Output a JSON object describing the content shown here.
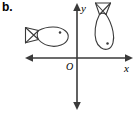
{
  "figure": {
    "part_label": "b.",
    "axes": {
      "x_label": "x",
      "y_label": "y",
      "origin_label": "O",
      "stroke_color": "#3a3a3a",
      "x_axis_y": 58,
      "y_axis_x": 77,
      "x_min": 25,
      "x_max": 133,
      "y_top": 3,
      "y_bottom": 110
    },
    "shapes": [
      {
        "name": "fish-preimage",
        "orientation": "horizontal-pointing-left",
        "quadrant": "II",
        "tail_style": "bowtie",
        "eye": "dot",
        "stroke_color": "#3a3a3a",
        "fill": "none"
      },
      {
        "name": "fish-image",
        "orientation": "vertical-pointing-up",
        "quadrant": "I",
        "tail_style": "bowtie",
        "eye": "dot",
        "stroke_color": "#3a3a3a",
        "fill": "none"
      }
    ]
  }
}
